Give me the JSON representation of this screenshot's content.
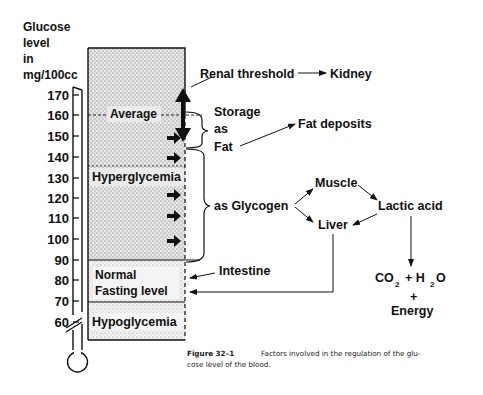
{
  "axis": {
    "title_lines": [
      "Glucose",
      "level",
      "in",
      "mg/100cc"
    ],
    "ticks": [
      "170",
      "160",
      "150",
      "140",
      "130",
      "120",
      "110",
      "100",
      "90",
      "80",
      "70",
      "60"
    ]
  },
  "zones": {
    "average": "Average",
    "hyperglycemia": "Hyperglycemia",
    "normal_line1": "Normal",
    "normal_line2": "Fasting level",
    "hypoglycemia": "Hypoglycemia"
  },
  "labels": {
    "renal_threshold": "Renal threshold",
    "kidney": "Kidney",
    "storage": "Storage",
    "as": "as",
    "fat": "Fat",
    "fat_deposits": "Fat deposits",
    "as_glycogen": "as Glycogen",
    "muscle": "Muscle",
    "liver": "Liver",
    "lactic_acid": "Lactic acid",
    "intestine": "Intestine",
    "co2": "CO",
    "co2_sub": "2",
    "plus_h2o": "+ H",
    "h2o_sub": "2",
    "h2o_o": "O",
    "plus": "+",
    "energy": "Energy"
  },
  "caption": {
    "figure": "Figure 32–1",
    "line1": "Factors involved in the regulation of the glu-",
    "line2": "cose level of the blood."
  }
}
